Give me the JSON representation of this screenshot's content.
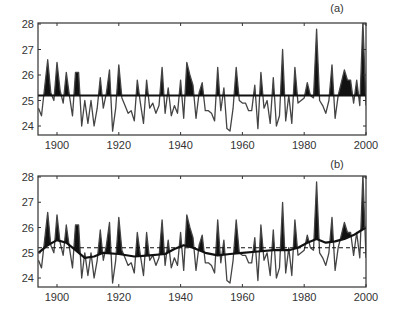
{
  "chart_data": [
    {
      "id": "a",
      "type": "line",
      "panel_label": "(a)",
      "title": "",
      "xlabel": "",
      "ylabel": "",
      "xlim": [
        1894,
        2000
      ],
      "ylim": [
        23.6,
        28.1
      ],
      "x_ticks": [
        1900,
        1920,
        1940,
        1960,
        1980,
        2000
      ],
      "y_ticks": [
        24,
        25,
        26,
        27,
        28
      ],
      "grid": false,
      "legend": null,
      "reference_line": {
        "style": "solid",
        "value": 25.2
      },
      "fill_above_reference": true,
      "series": [
        {
          "name": "SST",
          "x": [
            1894,
            1895,
            1896,
            1897,
            1898,
            1899,
            1900,
            1901,
            1902,
            1903,
            1904,
            1905,
            1906,
            1907,
            1908,
            1909,
            1910,
            1911,
            1912,
            1913,
            1914,
            1915,
            1916,
            1917,
            1918,
            1919,
            1920,
            1921,
            1922,
            1923,
            1924,
            1925,
            1926,
            1927,
            1928,
            1929,
            1930,
            1931,
            1932,
            1933,
            1934,
            1935,
            1936,
            1937,
            1938,
            1939,
            1940,
            1941,
            1942,
            1943,
            1944,
            1945,
            1946,
            1947,
            1948,
            1949,
            1950,
            1951,
            1952,
            1953,
            1954,
            1955,
            1956,
            1957,
            1958,
            1959,
            1960,
            1961,
            1962,
            1963,
            1964,
            1965,
            1966,
            1967,
            1968,
            1969,
            1970,
            1971,
            1972,
            1973,
            1974,
            1975,
            1976,
            1977,
            1978,
            1979,
            1980,
            1981,
            1982,
            1983,
            1984,
            1985,
            1986,
            1987,
            1988,
            1989,
            1990,
            1991,
            1992,
            1993,
            1994,
            1995,
            1996,
            1997,
            1998,
            1999,
            2000
          ],
          "values": [
            24.7,
            24.4,
            25.5,
            26.6,
            25.3,
            25.0,
            26.5,
            25.4,
            24.9,
            26.1,
            25.2,
            24.4,
            26.1,
            26.1,
            24.0,
            25.0,
            24.1,
            25.0,
            24.0,
            24.7,
            25.9,
            24.7,
            25.3,
            26.2,
            23.8,
            24.7,
            26.4,
            25.1,
            24.8,
            24.5,
            24.6,
            24.2,
            25.8,
            24.9,
            24.1,
            25.8,
            24.7,
            24.9,
            24.5,
            24.8,
            26.3,
            24.5,
            25.5,
            24.4,
            24.8,
            24.5,
            25.8,
            24.3,
            26.5,
            26.0,
            25.6,
            24.3,
            25.3,
            25.7,
            24.6,
            24.6,
            24.5,
            24.2,
            26.3,
            24.6,
            25.5,
            23.9,
            23.8,
            24.7,
            26.3,
            25.0,
            24.9,
            24.9,
            24.6,
            24.6,
            25.6,
            23.9,
            26.1,
            24.7,
            25.0,
            24.1,
            25.9,
            24.0,
            24.4,
            27.0,
            24.2,
            25.2,
            24.1,
            26.3,
            24.9,
            25.0,
            25.1,
            25.7,
            25.2,
            25.1,
            27.8,
            25.0,
            24.8,
            24.5,
            25.0,
            26.4,
            24.3,
            25.2,
            25.7,
            26.2,
            25.8,
            25.8,
            24.9,
            25.8,
            24.8,
            28.1,
            24.8
          ]
        }
      ]
    },
    {
      "id": "b",
      "type": "line",
      "panel_label": "(b)",
      "title": "",
      "xlabel": "",
      "ylabel": "",
      "xlim": [
        1894,
        2000
      ],
      "ylim": [
        23.6,
        28.1
      ],
      "x_ticks": [
        1900,
        1920,
        1940,
        1960,
        1980,
        2000
      ],
      "y_ticks": [
        24,
        25,
        26,
        27,
        28
      ],
      "grid": false,
      "legend": null,
      "reference_line": {
        "style": "dashed",
        "value": 25.2
      },
      "fill_above_smooth": true,
      "series": [
        {
          "name": "SST",
          "x": [
            1894,
            1895,
            1896,
            1897,
            1898,
            1899,
            1900,
            1901,
            1902,
            1903,
            1904,
            1905,
            1906,
            1907,
            1908,
            1909,
            1910,
            1911,
            1912,
            1913,
            1914,
            1915,
            1916,
            1917,
            1918,
            1919,
            1920,
            1921,
            1922,
            1923,
            1924,
            1925,
            1926,
            1927,
            1928,
            1929,
            1930,
            1931,
            1932,
            1933,
            1934,
            1935,
            1936,
            1937,
            1938,
            1939,
            1940,
            1941,
            1942,
            1943,
            1944,
            1945,
            1946,
            1947,
            1948,
            1949,
            1950,
            1951,
            1952,
            1953,
            1954,
            1955,
            1956,
            1957,
            1958,
            1959,
            1960,
            1961,
            1962,
            1963,
            1964,
            1965,
            1966,
            1967,
            1968,
            1969,
            1970,
            1971,
            1972,
            1973,
            1974,
            1975,
            1976,
            1977,
            1978,
            1979,
            1980,
            1981,
            1982,
            1983,
            1984,
            1985,
            1986,
            1987,
            1988,
            1989,
            1990,
            1991,
            1992,
            1993,
            1994,
            1995,
            1996,
            1997,
            1998,
            1999,
            2000
          ],
          "values": [
            24.7,
            24.4,
            25.5,
            26.6,
            25.3,
            25.0,
            26.5,
            25.4,
            24.9,
            26.1,
            25.2,
            24.4,
            26.1,
            26.1,
            24.0,
            25.0,
            24.1,
            25.0,
            24.0,
            24.7,
            25.9,
            24.7,
            25.3,
            26.2,
            23.8,
            24.7,
            26.4,
            25.1,
            24.8,
            24.5,
            24.6,
            24.2,
            25.8,
            24.9,
            24.1,
            25.8,
            24.7,
            24.9,
            24.5,
            24.8,
            26.3,
            24.5,
            25.5,
            24.4,
            24.8,
            24.5,
            25.8,
            24.3,
            26.5,
            26.0,
            25.6,
            24.3,
            25.3,
            25.7,
            24.6,
            24.6,
            24.5,
            24.2,
            26.3,
            24.6,
            25.5,
            23.9,
            23.8,
            24.7,
            26.3,
            25.0,
            24.9,
            24.9,
            24.6,
            24.6,
            25.6,
            23.9,
            26.1,
            24.7,
            25.0,
            24.1,
            25.9,
            24.0,
            24.4,
            27.0,
            24.2,
            25.2,
            24.1,
            26.3,
            24.9,
            25.0,
            25.1,
            25.7,
            25.2,
            25.1,
            27.8,
            25.0,
            24.8,
            24.5,
            25.0,
            26.4,
            24.3,
            25.2,
            25.7,
            26.2,
            25.8,
            25.8,
            24.9,
            25.8,
            24.8,
            28.1,
            24.8
          ]
        },
        {
          "name": "smoothed trend",
          "x": [
            1894,
            1897,
            1900,
            1903,
            1906,
            1909,
            1912,
            1915,
            1920,
            1925,
            1930,
            1935,
            1938,
            1941,
            1944,
            1948,
            1952,
            1956,
            1960,
            1965,
            1970,
            1975,
            1978,
            1981,
            1984,
            1987,
            1990,
            1993,
            1996,
            1998,
            2000
          ],
          "values": [
            25.0,
            25.3,
            25.5,
            25.4,
            25.1,
            24.8,
            24.85,
            25.0,
            24.95,
            24.85,
            24.9,
            24.95,
            25.15,
            25.3,
            25.2,
            25.0,
            24.9,
            24.95,
            25.0,
            25.05,
            25.1,
            25.1,
            25.2,
            25.4,
            25.55,
            25.4,
            25.45,
            25.55,
            25.7,
            25.85,
            26.0
          ]
        }
      ]
    }
  ]
}
